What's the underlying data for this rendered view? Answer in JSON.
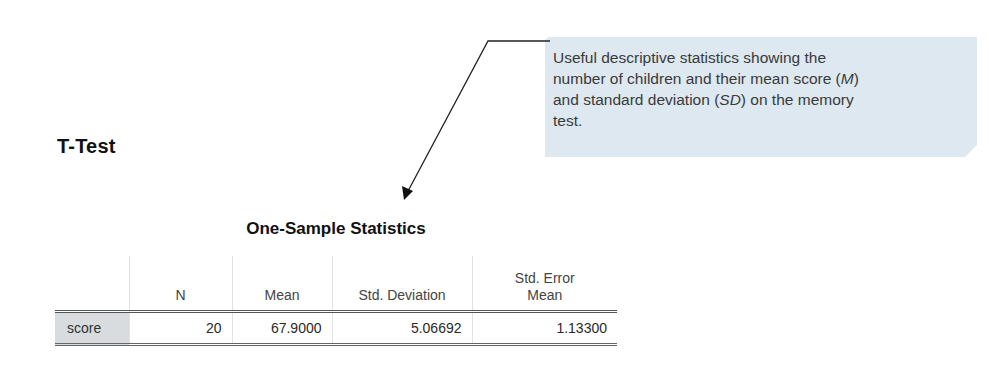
{
  "annotation": {
    "lines": [
      {
        "text": "Useful descriptive statistics showing the"
      },
      {
        "pre": "number of children and their mean score (",
        "em": "M",
        "post": ")"
      },
      {
        "pre": "and standard deviation (",
        "em": "SD",
        "post": ") on the memory"
      },
      {
        "text": "test."
      }
    ],
    "background_color": "#dde8f0"
  },
  "section_title": "T-Test",
  "table": {
    "title": "One-Sample Statistics",
    "headers": [
      "",
      "N",
      "Mean",
      "Std. Deviation",
      "Std. Error Mean"
    ],
    "header_lines": {
      "std_error_line1": "Std. Error",
      "std_error_line2": "Mean"
    },
    "rows": [
      {
        "label": "score",
        "n": "20",
        "mean": "67.9000",
        "std_deviation": "5.06692",
        "std_error_mean": "1.13300"
      }
    ]
  }
}
